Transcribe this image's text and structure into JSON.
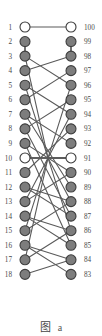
{
  "figure": {
    "caption_cjk": "图",
    "caption_latin": "a",
    "width": 102,
    "height": 336,
    "background_color": "#ffffff"
  },
  "style": {
    "node_fill_filled": "#7d7d7d",
    "node_fill_hollow": "#ffffff",
    "node_stroke": "#3d3d3d",
    "edge_color": "#5a5a5a",
    "label_color": "#4a4a4a",
    "node_radius": 5.0,
    "edge_width": 1.1
  },
  "layout": {
    "left_column_x": 25,
    "right_column_x": 71,
    "first_row_y": 27,
    "row_spacing": 14.55,
    "rows": 18,
    "left_label_x": 12,
    "right_label_x": 84,
    "label_font_size": 7.2,
    "hub_x": 48,
    "hub_row_index": 9
  },
  "graph": {
    "left_nodes": [
      {
        "id": "L1",
        "row": 0,
        "label": "1",
        "fill": "hollow"
      },
      {
        "id": "L2",
        "row": 1,
        "label": "2",
        "fill": "filled"
      },
      {
        "id": "L3",
        "row": 2,
        "label": "3",
        "fill": "filled"
      },
      {
        "id": "L4",
        "row": 3,
        "label": "4",
        "fill": "filled"
      },
      {
        "id": "L5",
        "row": 4,
        "label": "5",
        "fill": "filled"
      },
      {
        "id": "L6",
        "row": 5,
        "label": "6",
        "fill": "filled"
      },
      {
        "id": "L7",
        "row": 6,
        "label": "7",
        "fill": "filled"
      },
      {
        "id": "L8",
        "row": 7,
        "label": "8",
        "fill": "filled"
      },
      {
        "id": "L9",
        "row": 8,
        "label": "9",
        "fill": "filled"
      },
      {
        "id": "L10",
        "row": 9,
        "label": "10",
        "fill": "hollow"
      },
      {
        "id": "L11",
        "row": 10,
        "label": "11",
        "fill": "filled"
      },
      {
        "id": "L12",
        "row": 11,
        "label": "12",
        "fill": "filled"
      },
      {
        "id": "L13",
        "row": 12,
        "label": "13",
        "fill": "filled"
      },
      {
        "id": "L14",
        "row": 13,
        "label": "14",
        "fill": "filled"
      },
      {
        "id": "L15",
        "row": 14,
        "label": "15",
        "fill": "filled"
      },
      {
        "id": "L16",
        "row": 15,
        "label": "16",
        "fill": "filled"
      },
      {
        "id": "L17",
        "row": 16,
        "label": "17",
        "fill": "filled"
      },
      {
        "id": "L18",
        "row": 17,
        "label": "18",
        "fill": "filled"
      }
    ],
    "right_nodes": [
      {
        "id": "R100",
        "row": 0,
        "label": "100",
        "fill": "hollow"
      },
      {
        "id": "R99",
        "row": 1,
        "label": "99",
        "fill": "filled"
      },
      {
        "id": "R98",
        "row": 2,
        "label": "98",
        "fill": "filled"
      },
      {
        "id": "R97",
        "row": 3,
        "label": "97",
        "fill": "filled"
      },
      {
        "id": "R96",
        "row": 4,
        "label": "96",
        "fill": "filled"
      },
      {
        "id": "R95",
        "row": 5,
        "label": "95",
        "fill": "filled"
      },
      {
        "id": "R94",
        "row": 6,
        "label": "94",
        "fill": "filled"
      },
      {
        "id": "R93",
        "row": 7,
        "label": "93",
        "fill": "filled"
      },
      {
        "id": "R92",
        "row": 8,
        "label": "92",
        "fill": "filled"
      },
      {
        "id": "R91",
        "row": 9,
        "label": "91",
        "fill": "hollow"
      },
      {
        "id": "R90",
        "row": 10,
        "label": "90",
        "fill": "filled"
      },
      {
        "id": "R89",
        "row": 11,
        "label": "89",
        "fill": "filled"
      },
      {
        "id": "R88",
        "row": 12,
        "label": "88",
        "fill": "filled"
      },
      {
        "id": "R87",
        "row": 13,
        "label": "87",
        "fill": "filled"
      },
      {
        "id": "R86",
        "row": 14,
        "label": "86",
        "fill": "filled"
      },
      {
        "id": "R85",
        "row": 15,
        "label": "85",
        "fill": "filled"
      },
      {
        "id": "R84",
        "row": 16,
        "label": "84",
        "fill": "filled"
      },
      {
        "id": "R83",
        "row": 17,
        "label": "83",
        "fill": "filled"
      }
    ],
    "vertical_edges": [
      {
        "side": "left",
        "from_row": 1,
        "to_row": 2
      },
      {
        "side": "right",
        "from_row": 1,
        "to_row": 2
      }
    ],
    "cross_edges": [
      {
        "left_row": 0,
        "right_row": 0
      },
      {
        "left_row": 2,
        "right_row": 4
      },
      {
        "left_row": 3,
        "right_row": 2
      },
      {
        "left_row": 4,
        "right_row": 6
      },
      {
        "left_row": 5,
        "right_row": 3
      },
      {
        "left_row": 6,
        "right_row": 8
      },
      {
        "left_row": 7,
        "right_row": 5
      },
      {
        "left_row": 8,
        "right_row": 10
      },
      {
        "left_row": 9,
        "right_row": 9
      },
      {
        "left_row": 10,
        "right_row": 7
      },
      {
        "left_row": 11,
        "right_row": 12
      },
      {
        "left_row": 12,
        "right_row": 10
      },
      {
        "left_row": 13,
        "right_row": 14
      },
      {
        "left_row": 14,
        "right_row": 12
      },
      {
        "left_row": 15,
        "right_row": 16
      },
      {
        "left_row": 16,
        "right_row": 14
      },
      {
        "left_row": 17,
        "right_row": 16
      },
      {
        "left_row": 15,
        "right_row": 17
      },
      {
        "left_row": 13,
        "right_row": 15
      },
      {
        "left_row": 11,
        "right_row": 13
      },
      {
        "left_row": 6,
        "right_row": 11
      },
      {
        "left_row": 7,
        "right_row": 13
      },
      {
        "left_row": 8,
        "right_row": 15
      },
      {
        "left_row": 4,
        "right_row": 9
      },
      {
        "left_row": 2,
        "right_row": 9
      },
      {
        "left_row": 12,
        "right_row": 9
      },
      {
        "left_row": 14,
        "right_row": 9
      },
      {
        "left_row": 16,
        "right_row": 9
      },
      {
        "left_row": 9,
        "right_row": 4
      },
      {
        "left_row": 9,
        "right_row": 6
      },
      {
        "left_row": 9,
        "right_row": 12
      },
      {
        "left_row": 9,
        "right_row": 14
      }
    ]
  }
}
